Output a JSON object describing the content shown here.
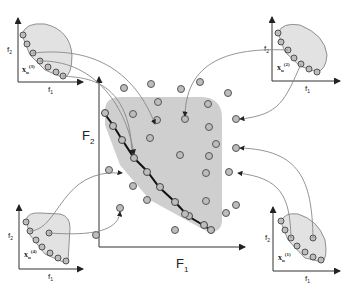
{
  "figure": {
    "main_plot": {
      "x_label": "F",
      "x_sub": "1",
      "y_label": "F",
      "y_sub": "2"
    },
    "subplots": [
      {
        "id": "top-left",
        "label": "x",
        "sub": "u",
        "sup": "(3)",
        "x_label": "f",
        "x_sub": "1",
        "y_label": "f",
        "y_sub": "2"
      },
      {
        "id": "top-right",
        "label": "x",
        "sub": "u",
        "sup": "(2)",
        "x_label": "f",
        "x_sub": "1",
        "y_label": "f",
        "y_sub": "2"
      },
      {
        "id": "bottom-left",
        "label": "x",
        "sub": "u",
        "sup": "(4)",
        "x_label": "f",
        "x_sub": "1",
        "y_label": "f",
        "y_sub": "2"
      },
      {
        "id": "bottom-right",
        "label": "x",
        "sub": "u",
        "sup": "(1)",
        "x_label": "f",
        "x_sub": "1",
        "y_label": "f",
        "y_sub": "2"
      }
    ],
    "colors": {
      "region_fill": "#cfcfcf",
      "subplot_fill": "#e2e2e2",
      "point_fill": "#bdbdbd",
      "stroke": "#333333",
      "arrow": "#777777"
    }
  }
}
